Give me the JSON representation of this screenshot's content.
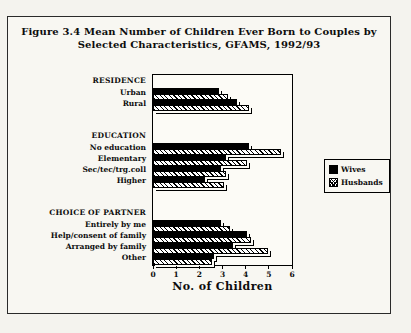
{
  "title": {
    "line1": "Figure 3.4  Mean Number of Children Ever Born to Couples by",
    "line2": "Selected Characteristics, GFAMS, 1992/93"
  },
  "legend": {
    "items": [
      {
        "label": "Wives",
        "swatch": "solid-black"
      },
      {
        "label": "Husbands",
        "swatch": "diagonal-hatch"
      }
    ],
    "position": "right"
  },
  "chart_data": {
    "type": "bar",
    "orientation": "horizontal",
    "title": "Figure 3.4 Mean Number of Children Ever Born to Couples by Selected Characteristics, GFAMS, 1992/93",
    "xlabel": "No. of Children",
    "xlim": [
      0,
      6
    ],
    "xticks": [
      0,
      1,
      2,
      3,
      4,
      5,
      6
    ],
    "grid": false,
    "series_names": [
      "Wives",
      "Husbands"
    ],
    "groups": [
      {
        "header": "RESIDENCE",
        "categories": [
          {
            "label": "Urban",
            "wives": 2.8,
            "husbands": 3.2
          },
          {
            "label": "Rural",
            "wives": 3.6,
            "husbands": 4.1
          }
        ]
      },
      {
        "header": "EDUCATION",
        "categories": [
          {
            "label": "No education",
            "wives": 4.1,
            "husbands": 5.5
          },
          {
            "label": "Elementary",
            "wives": 3.1,
            "husbands": 4.0
          },
          {
            "label": "Sec/tec/trg.coll",
            "wives": 2.9,
            "husbands": 3.1
          },
          {
            "label": "Higher",
            "wives": 2.2,
            "husbands": 3.0
          }
        ]
      },
      {
        "header": "CHOICE OF PARTNER",
        "categories": [
          {
            "label": "Entirely by me",
            "wives": 2.9,
            "husbands": 3.3
          },
          {
            "label": "Help/consent of family",
            "wives": 4.0,
            "husbands": 4.2
          },
          {
            "label": "Arranged by family",
            "wives": 3.4,
            "husbands": 4.9
          },
          {
            "label": "Other",
            "wives": 2.6,
            "husbands": 2.5
          }
        ]
      }
    ]
  },
  "colors": {
    "bar_wives": "#000000",
    "bar_husbands_pattern": "#000000",
    "frame": "#000000",
    "background": "#f4f3ee"
  }
}
